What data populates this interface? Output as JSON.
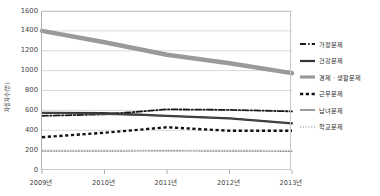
{
  "chart_data": {
    "type": "line",
    "title": "",
    "xlabel": "",
    "ylabel": "자살자수(명)",
    "categories": [
      "2009년",
      "2010년",
      "2011년",
      "2012년",
      "2013년"
    ],
    "ylim": [
      0,
      1600
    ],
    "yticks": [
      0,
      200,
      400,
      600,
      800,
      1000,
      1200,
      1400,
      1600
    ],
    "ytick_labels": [
      "0",
      "200",
      "400",
      "600",
      "800",
      "1000",
      "1200",
      "1400",
      "1600"
    ],
    "grid": true,
    "legend_position": "right",
    "series": [
      {
        "name": "가정문제",
        "style": "dash-dot",
        "color": "#1a1a1a",
        "width": 1.8,
        "values": [
          545,
          560,
          610,
          605,
          590
        ]
      },
      {
        "name": "건강문제",
        "style": "thick-dash",
        "color": "#333333",
        "width": 2.2,
        "values": [
          575,
          572,
          545,
          520,
          470
        ]
      },
      {
        "name": "경제 · 생활문제",
        "style": "solid-thick-gray",
        "color": "#9a9a9a",
        "width": 4.5,
        "values": [
          1400,
          1285,
          1160,
          1075,
          975
        ]
      },
      {
        "name": "근무문제",
        "style": "square-dash",
        "color": "#111111",
        "width": 2.4,
        "values": [
          330,
          375,
          430,
          395,
          395
        ]
      },
      {
        "name": "남녀문제",
        "style": "solid-thin",
        "color": "#4a4a4a",
        "width": 1.1,
        "values": [
          575,
          560,
          545,
          520,
          470
        ]
      },
      {
        "name": "학교문제",
        "style": "dotted",
        "color": "#8c8c8c",
        "width": 1.2,
        "values": [
          190,
          190,
          192,
          190,
          188
        ]
      }
    ]
  }
}
